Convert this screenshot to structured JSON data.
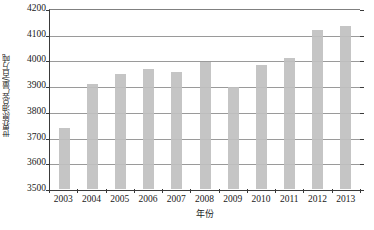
{
  "chart_data": {
    "type": "bar",
    "title": "",
    "xlabel": "年份",
    "ylabel": "世界原油总产量/百万吨",
    "categories": [
      "2003",
      "2004",
      "2005",
      "2006",
      "2007",
      "2008",
      "2009",
      "2010",
      "2011",
      "2012",
      "2013"
    ],
    "values": [
      3737,
      3907,
      3948,
      3968,
      3957,
      3993,
      3897,
      3982,
      4008,
      4117,
      4133
    ],
    "ylim": [
      3500,
      4200
    ],
    "ytick_step": 100,
    "yticks": [
      3500,
      3600,
      3700,
      3800,
      3900,
      4000,
      4100,
      4200
    ],
    "ytick_labels": [
      "3500",
      "3600",
      "3700",
      "3800",
      "3900",
      "4000",
      "4100",
      "4200"
    ],
    "grid": true,
    "legend": false,
    "legend_position": "none",
    "series": [
      {
        "name": "世界原油总产量",
        "color": "#c0c0c0",
        "values": [
          3737,
          3907,
          3948,
          3968,
          3957,
          3993,
          3897,
          3982,
          4008,
          4117,
          4133
        ]
      }
    ]
  },
  "colors": {
    "bar_fill": "#c0c0c0",
    "gridline": "#9a9a9a",
    "axis": "#3a3a3a",
    "background": "#ffffff",
    "text": "#1a1a1a"
  }
}
